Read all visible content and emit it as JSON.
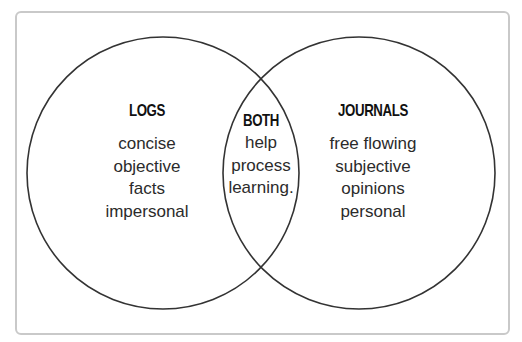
{
  "diagram": {
    "type": "venn",
    "colors": {
      "frame_border": "#c9c9c9",
      "circle_stroke": "#333333",
      "heading_text": "#111111",
      "body_text": "#2b2b2b",
      "background": "#ffffff"
    },
    "left": {
      "heading": "LOGS",
      "items": [
        "concise",
        "objective",
        "facts",
        "impersonal"
      ]
    },
    "overlap": {
      "heading": "BOTH",
      "items": [
        "help",
        "process",
        "learning."
      ]
    },
    "right": {
      "heading": "JOURNALS",
      "items": [
        "free flowing",
        "subjective",
        "opinions",
        "personal"
      ]
    }
  }
}
